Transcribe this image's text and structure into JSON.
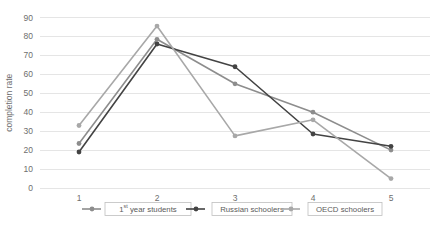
{
  "chart_data": {
    "type": "line",
    "title": "",
    "xlabel": "",
    "ylabel": "completion rate",
    "categories": [
      "1",
      "2",
      "3",
      "4",
      "5"
    ],
    "ylim": [
      0,
      90
    ],
    "yticks": [
      0,
      10,
      20,
      30,
      40,
      50,
      60,
      70,
      80,
      90
    ],
    "grid": true,
    "legend_position": "bottom",
    "series": [
      {
        "name": "1st year students",
        "name_prefix": "1",
        "name_superscript": "st",
        "name_suffix": " year students",
        "color": "#8d8d8d",
        "values": [
          23.5,
          78.5,
          55,
          40,
          20
        ]
      },
      {
        "name": "Russian schoolers",
        "color": "#434343",
        "values": [
          19,
          76,
          64,
          28.5,
          22
        ]
      },
      {
        "name": "OECD schoolers",
        "color": "#a8a8a8",
        "values": [
          33,
          85.5,
          27.5,
          36,
          5
        ]
      }
    ]
  },
  "axis": {
    "y_title": "completion rate",
    "y_tick_labels": [
      "90",
      "80",
      "70",
      "60",
      "50",
      "40",
      "30",
      "20",
      "10",
      "0"
    ],
    "x_tick_labels": [
      "1",
      "2",
      "3",
      "4",
      "5"
    ]
  },
  "legend": {
    "items": [
      {
        "label": "1st year students",
        "prefix": "1",
        "superscript": "st",
        "suffix": " year students",
        "color": "#8d8d8d"
      },
      {
        "label": "Russian schoolers",
        "prefix": "Russian schoolers",
        "superscript": "",
        "suffix": "",
        "color": "#434343"
      },
      {
        "label": "OECD schoolers",
        "prefix": "OECD schoolers",
        "superscript": "",
        "suffix": "",
        "color": "#a8a8a8"
      }
    ]
  },
  "colors": {
    "gridline": "#e2e2e2",
    "text": "#6e6e6e",
    "background": "#ffffff",
    "legend_border": "#bfbfbf"
  }
}
